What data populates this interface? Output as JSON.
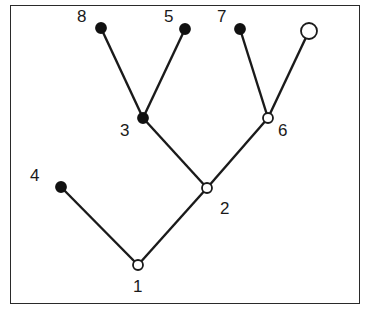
{
  "diagram": {
    "type": "tree",
    "colors": {
      "line": "#1a1a1a",
      "filled_node": "#111111",
      "open_node_fill": "#ffffff"
    },
    "nodes": [
      {
        "id": "1",
        "label": "1",
        "x": 138,
        "y": 265,
        "style": "open",
        "r": 5,
        "lx": 133,
        "ly": 278
      },
      {
        "id": "2",
        "label": "2",
        "x": 207,
        "y": 188,
        "style": "open",
        "r": 5,
        "lx": 220,
        "ly": 200
      },
      {
        "id": "3",
        "label": "3",
        "x": 143,
        "y": 118,
        "style": "filled",
        "r": 5,
        "lx": 120,
        "ly": 122
      },
      {
        "id": "4",
        "label": "4",
        "x": 61,
        "y": 187,
        "style": "filled",
        "r": 5,
        "lx": 30,
        "ly": 167
      },
      {
        "id": "5",
        "label": "5",
        "x": 185,
        "y": 29,
        "style": "filled",
        "r": 5,
        "lx": 164,
        "ly": 8
      },
      {
        "id": "6",
        "label": "6",
        "x": 268,
        "y": 118,
        "style": "open",
        "r": 5,
        "lx": 278,
        "ly": 122
      },
      {
        "id": "7",
        "label": "7",
        "x": 240,
        "y": 29,
        "style": "filled",
        "r": 5,
        "lx": 217,
        "ly": 8
      },
      {
        "id": "8",
        "label": "8",
        "x": 101,
        "y": 28,
        "style": "filled",
        "r": 5,
        "lx": 77,
        "ly": 8
      },
      {
        "id": "top-right",
        "label": "",
        "x": 309,
        "y": 31,
        "style": "open",
        "r": 8,
        "lx": 0,
        "ly": 0
      }
    ],
    "edges": [
      [
        "1",
        "4"
      ],
      [
        "1",
        "2"
      ],
      [
        "2",
        "3"
      ],
      [
        "2",
        "6"
      ],
      [
        "3",
        "8"
      ],
      [
        "3",
        "5"
      ],
      [
        "6",
        "7"
      ],
      [
        "6",
        "top-right"
      ]
    ]
  }
}
